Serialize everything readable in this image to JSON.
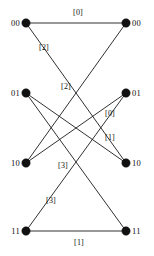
{
  "figure": {
    "type": "bipartite-trellis-graph",
    "background_color": "#ffffff",
    "line_color": "#1a1a1a",
    "node_color": "#111111",
    "width": 154,
    "height": 256
  },
  "nodes": {
    "left": [
      {
        "id": "L00",
        "label": "00",
        "x": 26,
        "y": 23
      },
      {
        "id": "L01",
        "label": "01",
        "x": 26,
        "y": 93
      },
      {
        "id": "L10",
        "label": "10",
        "x": 26,
        "y": 163
      },
      {
        "id": "L11",
        "label": "11",
        "x": 26,
        "y": 231
      }
    ],
    "right": [
      {
        "id": "R00",
        "label": "00",
        "x": 126,
        "y": 23
      },
      {
        "id": "R01",
        "label": "01",
        "x": 126,
        "y": 93
      },
      {
        "id": "R10",
        "label": "10",
        "x": 126,
        "y": 163
      },
      {
        "id": "R11",
        "label": "11",
        "x": 126,
        "y": 231
      }
    ]
  },
  "node_label_positions": {
    "left": [
      {
        "x": 20,
        "y": 23
      },
      {
        "x": 20,
        "y": 93
      },
      {
        "x": 20,
        "y": 163
      },
      {
        "x": 20,
        "y": 231
      }
    ],
    "right": [
      {
        "x": 132,
        "y": 23
      },
      {
        "x": 132,
        "y": 93
      },
      {
        "x": 132,
        "y": 163
      },
      {
        "x": 132,
        "y": 231
      }
    ]
  },
  "edges": [
    {
      "id": "e0",
      "from": "L00",
      "to": "R00",
      "label": "[0]",
      "x1": 26,
      "y1": 23,
      "x2": 126,
      "y2": 23
    },
    {
      "id": "e1",
      "from": "L00",
      "to": "R10",
      "label": "[2]",
      "x1": 26,
      "y1": 23,
      "x2": 126,
      "y2": 163
    },
    {
      "id": "e2",
      "from": "L01",
      "to": "R10",
      "label": "[1]",
      "x1": 26,
      "y1": 93,
      "x2": 126,
      "y2": 163
    },
    {
      "id": "e3",
      "from": "L01",
      "to": "R11",
      "label": "[3]",
      "x1": 26,
      "y1": 93,
      "x2": 126,
      "y2": 231
    },
    {
      "id": "e4",
      "from": "L10",
      "to": "R00",
      "label": "[2]",
      "x1": 26,
      "y1": 163,
      "x2": 126,
      "y2": 23
    },
    {
      "id": "e5",
      "from": "L10",
      "to": "R01",
      "label": "[0]",
      "x1": 26,
      "y1": 163,
      "x2": 126,
      "y2": 93
    },
    {
      "id": "e6",
      "from": "L11",
      "to": "R01",
      "label": "[3]",
      "x1": 26,
      "y1": 231,
      "x2": 126,
      "y2": 93
    },
    {
      "id": "e7",
      "from": "L11",
      "to": "R11",
      "label": "[1]",
      "x1": 26,
      "y1": 231,
      "x2": 126,
      "y2": 231
    }
  ],
  "edge_label_positions": [
    {
      "id": "e0",
      "text": "[0]",
      "x": 78,
      "y": 13
    },
    {
      "id": "e1",
      "text": "[2]",
      "x": 44,
      "y": 48
    },
    {
      "id": "e4",
      "text": "[2]",
      "x": 66,
      "y": 87
    },
    {
      "id": "e5",
      "text": "[0]",
      "x": 110,
      "y": 114
    },
    {
      "id": "e2",
      "text": "[1]",
      "x": 110,
      "y": 138
    },
    {
      "id": "e3",
      "text": "[3]",
      "x": 63,
      "y": 166
    },
    {
      "id": "e6",
      "text": "[3]",
      "x": 51,
      "y": 201
    },
    {
      "id": "e7",
      "text": "[1]",
      "x": 79,
      "y": 243
    }
  ],
  "node_radius": 4.2
}
